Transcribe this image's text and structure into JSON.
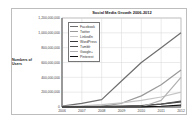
{
  "chart_data": {
    "type": "line",
    "title": "Social Media Growth 2006-2012",
    "xlabel": "",
    "ylabel": "Numbers of Users",
    "x": [
      "2006",
      "2007",
      "2008",
      "2009",
      "2010",
      "2011",
      "2012"
    ],
    "ylim": [
      0,
      1200000000
    ],
    "yticks": [
      "0",
      "200,000,000",
      "400,000,000",
      "600,000,000",
      "800,000,000",
      "1,000,000,000",
      "1,200,000,000"
    ],
    "grid": true,
    "legend_position": "upper-left inside",
    "series": [
      {
        "name": "Facebook",
        "color": "#6e6e6e",
        "values": [
          12000000,
          50000000,
          100000000,
          350000000,
          600000000,
          800000000,
          1000000000
        ]
      },
      {
        "name": "Twitter",
        "color": "#9a9a9a",
        "values": [
          0,
          5000000,
          10000000,
          50000000,
          150000000,
          300000000,
          500000000
        ]
      },
      {
        "name": "LinkedIn",
        "color": "#c4c4c4",
        "values": [
          8000000,
          17000000,
          33000000,
          55000000,
          90000000,
          135000000,
          200000000
        ]
      },
      {
        "name": "WordPress",
        "color": "#3a3a3a",
        "values": [
          2000000,
          4000000,
          8000000,
          12000000,
          20000000,
          40000000,
          70000000
        ]
      },
      {
        "name": "Tumblr",
        "color": "#555555",
        "values": [
          0,
          1000000,
          3000000,
          6000000,
          15000000,
          40000000,
          80000000
        ]
      },
      {
        "name": "Google+",
        "color": "#b0b0b0",
        "values": [
          0,
          0,
          0,
          0,
          0,
          90000000,
          400000000
        ]
      },
      {
        "name": "Pinterest",
        "color": "#111111",
        "values": [
          0,
          0,
          0,
          0,
          1000000,
          10000000,
          25000000
        ]
      }
    ]
  }
}
